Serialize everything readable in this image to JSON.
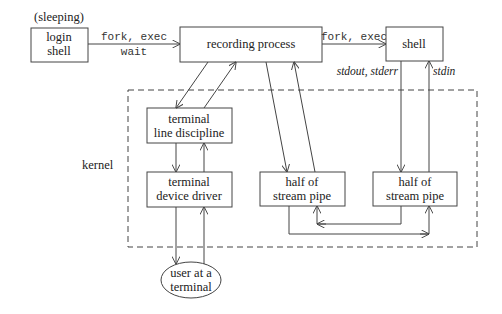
{
  "diagram": {
    "nodes": {
      "login_shell": {
        "line1": "login",
        "line2": "shell",
        "note": "(sleeping)"
      },
      "recording_process": {
        "label": "recording process"
      },
      "shell": {
        "label": "shell"
      },
      "line_discipline": {
        "line1": "terminal",
        "line2": "line discipline"
      },
      "device_driver": {
        "line1": "terminal",
        "line2": "device driver"
      },
      "pipe_left": {
        "line1": "half of",
        "line2": "stream pipe"
      },
      "pipe_right": {
        "line1": "half of",
        "line2": "stream pipe"
      },
      "user": {
        "line1": "user at a",
        "line2": "terminal"
      }
    },
    "kernel_label": "kernel",
    "edges": {
      "login_to_recording_top": "fork, exec",
      "login_to_recording_bottom": "wait",
      "recording_to_shell": "fork, exec",
      "shell_stdout": "stdout, stderr",
      "shell_stdin": "stdin"
    },
    "colors": {
      "stroke": "#444444",
      "background": "#ffffff",
      "text": "#222222"
    }
  }
}
